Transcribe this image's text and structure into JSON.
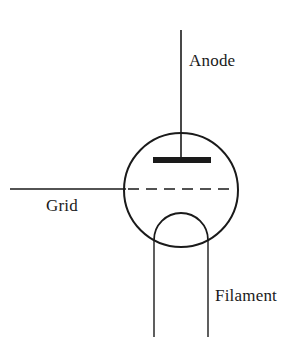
{
  "diagram": {
    "type": "schematic",
    "background_color": "#ffffff",
    "stroke_color": "#1a1a1a",
    "labels": {
      "anode": "Anode",
      "grid": "Grid",
      "filament": "Filament"
    },
    "elements": {
      "envelope": {
        "name": "tube-envelope-circle",
        "shape": "circle",
        "cx": 181,
        "cy": 190,
        "r": 57,
        "stroke_width": 2
      },
      "anode_lead": {
        "name": "anode-lead-line",
        "shape": "line",
        "x1": 181,
        "y1": 30,
        "x2": 181,
        "y2": 160,
        "stroke_width": 1.6
      },
      "anode_plate": {
        "name": "anode-plate-bar",
        "shape": "rect",
        "x": 153,
        "y": 157,
        "width": 58,
        "height": 6,
        "fill": "#1a1a1a"
      },
      "grid_lead": {
        "name": "grid-lead-line",
        "shape": "line",
        "x1": 10,
        "y1": 189,
        "x2": 126,
        "y2": 189,
        "stroke_width": 1.4
      },
      "grid_dashed": {
        "name": "grid-dashed-line",
        "shape": "line",
        "x1": 128,
        "y1": 189,
        "x2": 236,
        "y2": 189,
        "stroke_width": 1.6,
        "dash": "11 7"
      },
      "filament_arc": {
        "name": "filament-arc",
        "shape": "arc",
        "cx": 181,
        "cy": 240,
        "rx": 27,
        "ry": 27,
        "start_x": 154,
        "start_y": 240,
        "end_x": 208,
        "end_y": 240,
        "stroke_width": 1.8
      },
      "filament_lead_left": {
        "name": "filament-lead-left",
        "shape": "line",
        "x1": 154,
        "y1": 240,
        "x2": 154,
        "y2": 337,
        "stroke_width": 1.4
      },
      "filament_lead_right": {
        "name": "filament-lead-right",
        "shape": "line",
        "x1": 208,
        "y1": 240,
        "x2": 208,
        "y2": 337,
        "stroke_width": 1.4
      }
    }
  }
}
